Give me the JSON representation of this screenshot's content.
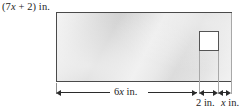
{
  "figure": {
    "type": "geometry-diagram",
    "colors": {
      "background": "#ffffff",
      "sheet_outline": "#4a4a4a",
      "sheet_fill_light": "#f4f4f4",
      "sheet_fill_dark": "#cfcfcf",
      "cutout_fill": "#ffffff",
      "cutout_outline": "#545454",
      "dimension_line": "#2b2b2b",
      "extension_line": "#a8a8a8",
      "text": "#1d1d1d"
    },
    "labels": {
      "height": {
        "prefix": "(7",
        "variable": "x",
        "suffix": " + 2) in."
      },
      "width_main": {
        "coefficient": "6",
        "variable": "x",
        "unit": " in."
      },
      "segment_2in": "2 in.",
      "segment_x": {
        "variable": "x",
        "unit": " in."
      }
    }
  }
}
